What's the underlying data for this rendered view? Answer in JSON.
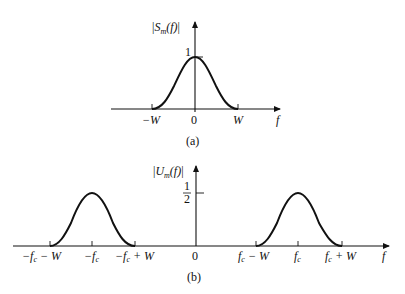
{
  "panels": [
    {
      "id": "a",
      "caption": "(a)",
      "y_label": "|S_m(f)|",
      "y_label_parts": {
        "bar_l": "|",
        "S": "S",
        "sub": "m",
        "arg": "(f)",
        "bar_r": "|"
      },
      "peak_label": "1",
      "x_axis_label": "f",
      "ticks": [
        {
          "label": "−W",
          "pos": "-W"
        },
        {
          "label": "0",
          "pos": "0"
        },
        {
          "label": "W",
          "pos": "W"
        }
      ]
    },
    {
      "id": "b",
      "caption": "(b)",
      "y_label": "|U_m(f)|",
      "y_label_parts": {
        "bar_l": "|",
        "U": "U",
        "sub": "m",
        "arg": "(f)",
        "bar_r": "|"
      },
      "peak_label_num": "1",
      "peak_label_den": "2",
      "x_axis_label": "f",
      "ticks": [
        {
          "label": "−f_c − W",
          "parts": [
            "−f",
            "c",
            " − W"
          ]
        },
        {
          "label": "−f_c",
          "parts": [
            "−f",
            "c",
            ""
          ]
        },
        {
          "label": "−f_c + W",
          "parts": [
            "−f",
            "c",
            " + W"
          ]
        },
        {
          "label": "0",
          "parts": [
            "0",
            "",
            ""
          ]
        },
        {
          "label": "f_c − W",
          "parts": [
            "f",
            "c",
            " − W"
          ]
        },
        {
          "label": "f_c",
          "parts": [
            "f",
            "c",
            ""
          ]
        },
        {
          "label": "f_c + W",
          "parts": [
            "f",
            "c",
            " + W"
          ]
        }
      ]
    }
  ],
  "colors": {
    "ink": "#111111",
    "background": "#ffffff"
  }
}
